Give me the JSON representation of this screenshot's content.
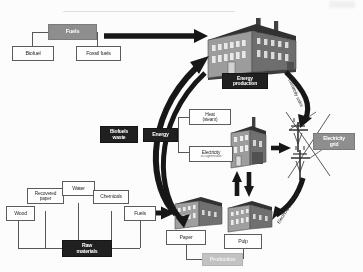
{
  "diagram": {
    "colors": {
      "dark_box": "#1d1d1d",
      "gray_box": "#8d8d8d",
      "light_gray_box": "#c2c2c2",
      "white_box": "#ffffff",
      "outline": "#5a5a5a",
      "arrow": "#141414",
      "building_roof": "#3a3a3a",
      "building_wall": "#9a9a9a",
      "building_side": "#6e6e6e"
    },
    "inputs_top": {
      "group_label": "Fuels",
      "children": [
        {
          "label": "Biofuel"
        },
        {
          "label": "Fossil fuels"
        }
      ]
    },
    "energy_production": {
      "label": "Energy production",
      "label_line1": "Energy",
      "label_line2": "production",
      "icon": "factory-building-icon"
    },
    "energy_outputs": {
      "group_label": "Energy",
      "children": [
        {
          "label": "Heat",
          "label_line2": "(steam)",
          "sub": ""
        },
        {
          "label": "Electricity",
          "sub": "as cogeneration"
        }
      ]
    },
    "biofuels_waste": {
      "label": "Biofuels waste",
      "label_line1": "Biofuels",
      "label_line2": "waste"
    },
    "electricity_grid": {
      "label": "Electricity grid",
      "label_line1": "Electricity",
      "label_line2": "grid",
      "icon": "transmission-pylon-icon"
    },
    "raw_materials": {
      "group_label": "Raw materials",
      "group_label_line1": "Raw",
      "group_label_line2": "materials",
      "children": [
        {
          "label": "Wood"
        },
        {
          "label": "Recovered paper",
          "label_line1": "Recovered",
          "label_line2": "paper"
        },
        {
          "label": "Water"
        },
        {
          "label": "Chemicals"
        },
        {
          "label": "Fuels"
        }
      ]
    },
    "production": {
      "label": "Production",
      "outputs": [
        {
          "label": "Paper",
          "icon": "mill-building-icon"
        },
        {
          "label": "Pulp",
          "icon": "mill-building-icon"
        }
      ]
    },
    "flow_labels": {
      "electricity_sales": "Electricity sales",
      "electricity_purchase": "Electricity purchase"
    },
    "arrows": {
      "fuels_to_energy_production": "straight-arrow-right",
      "biofuels_waste_to_energy_production": "curved-arrow-up",
      "raw_materials_to_production": "straight-arrow-right",
      "energy_production_to_grid": "curved-arrow-down-right",
      "grid_to_production": "curved-arrow-down-left",
      "mill_to_grid": "straight-arrow-right",
      "production_exchange": "double-vertical-arrow"
    }
  }
}
